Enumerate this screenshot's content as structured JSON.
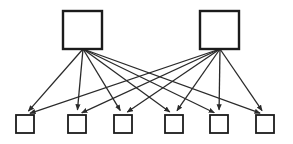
{
  "diagram": {
    "type": "node-link-diagram",
    "canvas": {
      "width": 293,
      "height": 144,
      "background": "#ffffff"
    },
    "style": {
      "node_stroke": "#1b1b1b",
      "node_fill": "#ffffff",
      "node_stroke_width": 2.4,
      "edge_stroke": "#2a2a2a",
      "edge_stroke_width": 1.3,
      "arrowhead": "filled-triangle"
    },
    "top_nodes": [
      {
        "id": "T1",
        "label": "",
        "x": 63,
        "y": 11,
        "w": 39,
        "h": 38,
        "anchor_x": 83,
        "anchor_y": 49
      },
      {
        "id": "T2",
        "label": "",
        "x": 200,
        "y": 11,
        "w": 39,
        "h": 38,
        "anchor_x": 220,
        "anchor_y": 49
      }
    ],
    "bottom_nodes": [
      {
        "id": "B1",
        "label": "",
        "x": 16,
        "y": 115,
        "w": 18,
        "h": 18,
        "anchor_x": 25,
        "anchor_y": 115
      },
      {
        "id": "B2",
        "label": "",
        "x": 68,
        "y": 115,
        "w": 18,
        "h": 18,
        "anchor_x": 77,
        "anchor_y": 115
      },
      {
        "id": "B3",
        "label": "",
        "x": 114,
        "y": 115,
        "w": 18,
        "h": 18,
        "anchor_x": 123,
        "anchor_y": 115
      },
      {
        "id": "B4",
        "label": "",
        "x": 165,
        "y": 115,
        "w": 18,
        "h": 18,
        "anchor_x": 174,
        "anchor_y": 115
      },
      {
        "id": "B5",
        "label": "",
        "x": 210,
        "y": 115,
        "w": 18,
        "h": 18,
        "anchor_x": 219,
        "anchor_y": 115
      },
      {
        "id": "B6",
        "label": "",
        "x": 256,
        "y": 115,
        "w": 18,
        "h": 18,
        "anchor_x": 265,
        "anchor_y": 115
      }
    ],
    "edges": [
      {
        "from": "T1",
        "to": "B1",
        "directed": true
      },
      {
        "from": "T1",
        "to": "B2",
        "directed": true
      },
      {
        "from": "T1",
        "to": "B3",
        "directed": true
      },
      {
        "from": "T1",
        "to": "B4",
        "directed": true
      },
      {
        "from": "T1",
        "to": "B5",
        "directed": true
      },
      {
        "from": "T1",
        "to": "B6",
        "directed": true
      },
      {
        "from": "T2",
        "to": "B1",
        "directed": true
      },
      {
        "from": "T2",
        "to": "B2",
        "directed": true
      },
      {
        "from": "T2",
        "to": "B3",
        "directed": true
      },
      {
        "from": "T2",
        "to": "B4",
        "directed": true
      },
      {
        "from": "T2",
        "to": "B5",
        "directed": true
      },
      {
        "from": "T2",
        "to": "B6",
        "directed": true
      }
    ],
    "edge_count": 12,
    "node_count": 8
  }
}
